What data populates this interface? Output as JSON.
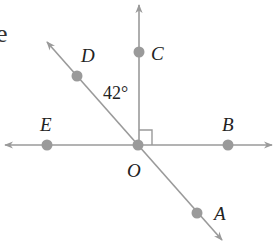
{
  "diagram": {
    "type": "geometry-angles",
    "origin_label": "O",
    "points": [
      {
        "label": "A",
        "x": 197,
        "y": 213
      },
      {
        "label": "B",
        "x": 228,
        "y": 145
      },
      {
        "label": "C",
        "x": 139,
        "y": 52
      },
      {
        "label": "D",
        "x": 77,
        "y": 76
      },
      {
        "label": "E",
        "x": 47,
        "y": 145
      },
      {
        "label": "O",
        "x": 138,
        "y": 145
      }
    ],
    "labels": {
      "A": "A",
      "B": "B",
      "C": "C",
      "D": "D",
      "E": "E",
      "O": "O"
    },
    "angle_label": "42°",
    "right_angle_marker": "∠COB = 90°",
    "text_fragment": "e",
    "colors": {
      "line": "#9a9a9a",
      "point": "#9a9a9a",
      "text": "#222222"
    }
  }
}
